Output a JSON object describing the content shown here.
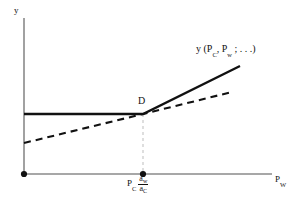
{
  "figure": {
    "kind": "economics-line-diagram",
    "background": "#ffffff",
    "ink": "#111111",
    "guide_color": "#bdbdbd",
    "axis_color": "#808080"
  },
  "axes": {
    "y_label": "y",
    "x_label_base": "P",
    "x_label_sub": "W",
    "x_label_full": "Pw",
    "origin_dot": true
  },
  "annotations": {
    "kink_point_label": "D",
    "curve_label_full": "y (PC , Pw ; . . .)",
    "curve_label_parts": {
      "lead": "y (P",
      "sub1": "C",
      "mid": ", P",
      "sub2": "w",
      "tail": " ; . . .)"
    },
    "x_tick": {
      "base": "P",
      "base_sub": "C",
      "fraction_numerator": "a",
      "fraction_numerator_sub": "w",
      "fraction_denominator": "a",
      "fraction_denominator_sub": "C",
      "full": "PC aw/aC"
    }
  },
  "chart_data": {
    "type": "line",
    "title": "",
    "xlabel": "Pw",
    "ylabel": "y",
    "grid": false,
    "legend": "none",
    "xlim": [
      0,
      1
    ],
    "ylim": [
      0,
      1
    ],
    "axis_pixels": {
      "x_axis_y": 174,
      "y_axis_x": 24,
      "x_axis_end": 272,
      "y_axis_top": 18
    },
    "kink_point": {
      "label": "D",
      "x_px": 143,
      "y_px": 114
    },
    "series": [
      {
        "name": "y (PC, Pw ; . . .)",
        "style": "solid",
        "width": 2.4,
        "color": "#111111",
        "points_px": [
          [
            24,
            114
          ],
          [
            143,
            114
          ],
          [
            240,
            66
          ]
        ]
      },
      {
        "name": "reference-schedule",
        "style": "dashed",
        "width": 2.1,
        "color": "#111111",
        "dash": "7,5",
        "points_px": [
          [
            24,
            143
          ],
          [
            143,
            114
          ],
          [
            232,
            92
          ]
        ]
      },
      {
        "name": "kink-guide",
        "style": "dashed",
        "width": 1,
        "color": "#bdbdbd",
        "dash": "3,3",
        "points_px": [
          [
            143,
            114
          ],
          [
            143,
            174
          ]
        ]
      }
    ],
    "markers": [
      {
        "name": "origin-dot",
        "x_px": 24,
        "y_px": 174,
        "r": 3.1,
        "color": "#111111"
      },
      {
        "name": "x-tick-dot",
        "x_px": 143,
        "y_px": 174,
        "r": 3.1,
        "color": "#111111"
      }
    ]
  }
}
